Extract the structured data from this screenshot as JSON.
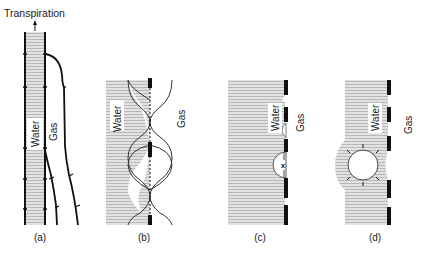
{
  "figure": {
    "top_label": "Transpiration",
    "water_label": "Water",
    "gas_label": "Gas",
    "panels": [
      {
        "id": "a",
        "caption": "(a)",
        "description": "Water column in xylem conduit under tension, adjacent gas-filled conduits"
      },
      {
        "id": "b",
        "caption": "(b)",
        "description": "Pit membrane with air-water menisci bulging through pores"
      },
      {
        "id": "c",
        "caption": "(c)",
        "description": "Air seeding: meniscus pulled through pore, bubble forming at wall (x)"
      },
      {
        "id": "d",
        "caption": "(d)",
        "description": "Bubble expands into water-filled conduit (cavitation)"
      }
    ]
  },
  "colors": {
    "ink": "#111111",
    "water_fill": "#d9d9d9",
    "water_stripe": "#bdbdbd",
    "background": "#ffffff"
  }
}
